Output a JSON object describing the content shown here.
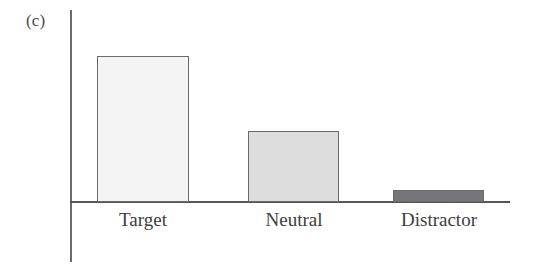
{
  "panel": {
    "label": "(c)"
  },
  "chart_data": {
    "type": "bar",
    "title": "",
    "subtitle": "",
    "xlabel": "",
    "ylabel": "",
    "categories": [
      "Target",
      "Neutral",
      "Distractor"
    ],
    "values": [
      100,
      49,
      8
    ],
    "ylim": [
      0,
      131
    ],
    "grid": false,
    "legend": null,
    "axis_ticks": {
      "x": [
        "Target",
        "Neutral",
        "Distractor"
      ],
      "y": []
    },
    "annotations": [
      "(c)"
    ],
    "series": [
      {
        "name": "",
        "values": [
          100,
          49,
          8
        ]
      }
    ],
    "bar_colors": [
      "#f4f4f4",
      "#dddddd",
      "#76767a"
    ],
    "bar_edge_color": "#6a6a6e",
    "axis_color": "#55555a",
    "background_color": "#ffffff"
  },
  "bars": [
    {
      "label": "Target",
      "value": 100,
      "fill": "#f4f4f4",
      "left": 97,
      "width": 92,
      "top": 56,
      "height": 146,
      "label_left": 97,
      "label_width": 92
    },
    {
      "label": "Neutral",
      "value": 49,
      "fill": "#dddddd",
      "left": 248,
      "width": 91,
      "top": 131,
      "height": 71,
      "label_left": 244,
      "label_width": 100
    },
    {
      "label": "Distractor",
      "value": 8,
      "fill": "#76767a",
      "left": 393,
      "width": 91,
      "top": 190,
      "height": 12,
      "label_left": 383,
      "label_width": 112
    }
  ]
}
